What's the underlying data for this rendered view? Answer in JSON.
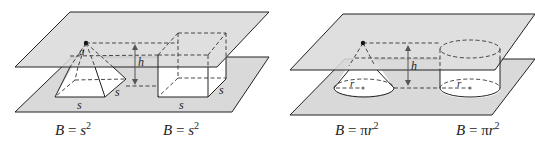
{
  "figure": {
    "panels": [
      {
        "id": "pyramid-prism",
        "labels": {
          "apex": "a",
          "height": "h",
          "side_front": "s",
          "side_depth": "s",
          "prism_front": "s",
          "prism_depth": "s"
        },
        "captions": [
          {
            "var": "B",
            "eq": "=",
            "base": "s",
            "exp": "2"
          },
          {
            "var": "B",
            "eq": "=",
            "base": "s",
            "exp": "2"
          }
        ]
      },
      {
        "id": "cone-cylinder",
        "labels": {
          "height": "h",
          "cone_radius": "r",
          "cyl_radius": "r"
        },
        "captions": [
          {
            "var": "B",
            "eq": "=",
            "pi": "π",
            "base": "r",
            "exp": "2"
          },
          {
            "var": "B",
            "eq": "=",
            "pi": "π",
            "base": "r",
            "exp": "2"
          }
        ]
      }
    ]
  }
}
